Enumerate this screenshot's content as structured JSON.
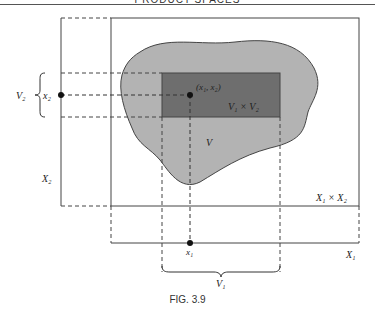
{
  "header": {
    "title": "PRODUCT SPACES"
  },
  "figure": {
    "caption": "FIG. 3.9",
    "labels": {
      "product_space": "X₁ × X₂",
      "axis_x1": "X₁",
      "axis_x2": "X₂",
      "open_set": "V",
      "inner_rect": "V₁ × V₂",
      "point": "(x₁, x₂)",
      "point_x1": "x₁",
      "point_x2": "x₂",
      "brace_v1": "V₁",
      "brace_v2": "V₂"
    },
    "colors": {
      "blob_fill": "#b3b3b3",
      "inner_rect_fill": "#6e6e6e",
      "line": "#333333"
    }
  }
}
